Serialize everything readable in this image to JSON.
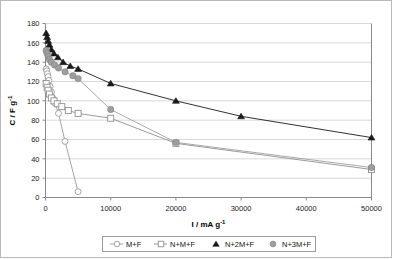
{
  "chart_data": {
    "type": "line",
    "title": "",
    "xlabel": "I / mA g-1",
    "xlabel_base": "I / mA g",
    "xlabel_exp": "-1",
    "ylabel": "C / F g-1",
    "ylabel_base": "C / F g",
    "ylabel_exp": "-1",
    "xlim": [
      0,
      50000
    ],
    "ylim": [
      0,
      180
    ],
    "xticks": [
      0,
      10000,
      20000,
      30000,
      40000,
      50000
    ],
    "xtick_labels": [
      "0",
      "10000",
      "20000",
      "30000",
      "40000",
      "50000"
    ],
    "yticks": [
      0,
      20,
      40,
      60,
      80,
      100,
      120,
      140,
      160,
      180
    ],
    "ytick_labels": [
      "0",
      "20",
      "40",
      "60",
      "80",
      "100",
      "120",
      "140",
      "160",
      "180"
    ],
    "grid": "horizontal",
    "legend_position": "bottom",
    "series": [
      {
        "name": "M+F",
        "marker": "open-circle",
        "color": "#9a9a9a",
        "fill": "#ffffff",
        "points": [
          {
            "x": 100,
            "y": 133
          },
          {
            "x": 200,
            "y": 131
          },
          {
            "x": 300,
            "y": 128
          },
          {
            "x": 400,
            "y": 125
          },
          {
            "x": 500,
            "y": 121
          },
          {
            "x": 700,
            "y": 115
          },
          {
            "x": 900,
            "y": 109
          },
          {
            "x": 1100,
            "y": 103
          },
          {
            "x": 1400,
            "y": 98
          },
          {
            "x": 2000,
            "y": 87
          },
          {
            "x": 3000,
            "y": 58
          },
          {
            "x": 5000,
            "y": 6
          }
        ]
      },
      {
        "name": "N+M+F",
        "marker": "open-square",
        "color": "#8f8f8f",
        "fill": "#ffffff",
        "points": [
          {
            "x": 100,
            "y": 118
          },
          {
            "x": 250,
            "y": 114
          },
          {
            "x": 400,
            "y": 111
          },
          {
            "x": 600,
            "y": 107
          },
          {
            "x": 900,
            "y": 103
          },
          {
            "x": 1300,
            "y": 100
          },
          {
            "x": 1800,
            "y": 97
          },
          {
            "x": 2500,
            "y": 94
          },
          {
            "x": 3500,
            "y": 90
          },
          {
            "x": 5000,
            "y": 87
          },
          {
            "x": 10000,
            "y": 82
          },
          {
            "x": 20000,
            "y": 56
          },
          {
            "x": 50000,
            "y": 29
          }
        ]
      },
      {
        "name": "N+2M+F",
        "marker": "filled-triangle",
        "color": "#1a1a1a",
        "fill": "#1a1a1a",
        "points": [
          {
            "x": 100,
            "y": 170
          },
          {
            "x": 250,
            "y": 166
          },
          {
            "x": 400,
            "y": 162
          },
          {
            "x": 600,
            "y": 158
          },
          {
            "x": 900,
            "y": 153
          },
          {
            "x": 1300,
            "y": 149
          },
          {
            "x": 1900,
            "y": 145
          },
          {
            "x": 2700,
            "y": 140
          },
          {
            "x": 3800,
            "y": 136
          },
          {
            "x": 5000,
            "y": 133
          },
          {
            "x": 10000,
            "y": 118
          },
          {
            "x": 20000,
            "y": 100
          },
          {
            "x": 30000,
            "y": 84
          },
          {
            "x": 50000,
            "y": 62
          }
        ]
      },
      {
        "name": "N+3M+F",
        "marker": "filled-circle",
        "color": "#9e9e9e",
        "fill": "#9e9e9e",
        "points": [
          {
            "x": 100,
            "y": 152
          },
          {
            "x": 250,
            "y": 149
          },
          {
            "x": 400,
            "y": 146
          },
          {
            "x": 600,
            "y": 143
          },
          {
            "x": 900,
            "y": 140
          },
          {
            "x": 1400,
            "y": 137
          },
          {
            "x": 2000,
            "y": 134
          },
          {
            "x": 3000,
            "y": 130
          },
          {
            "x": 4200,
            "y": 126
          },
          {
            "x": 5000,
            "y": 123
          },
          {
            "x": 10000,
            "y": 91
          },
          {
            "x": 20000,
            "y": 57
          },
          {
            "x": 50000,
            "y": 31
          }
        ]
      }
    ],
    "legend": [
      {
        "label": "M+F",
        "marker": "open-circle",
        "color": "#9a9a9a",
        "fill": "#ffffff"
      },
      {
        "label": "N+M+F",
        "marker": "open-square",
        "color": "#8f8f8f",
        "fill": "#ffffff"
      },
      {
        "label": "N+2M+F",
        "marker": "filled-triangle",
        "color": "#1a1a1a",
        "fill": "#1a1a1a"
      },
      {
        "label": "N+3M+F",
        "marker": "filled-circle",
        "color": "#9e9e9e",
        "fill": "#9e9e9e"
      }
    ]
  }
}
